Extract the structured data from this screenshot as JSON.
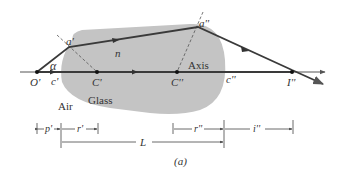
{
  "diagram": {
    "caption": "(a)",
    "colors": {
      "glass": "#c4c4c4",
      "ray": "#3a3a3a",
      "axis": "#555555",
      "dashed": "#555555",
      "background": "#ffffff"
    },
    "media": {
      "outside": "Air",
      "inside": "Glass",
      "index_label": "n"
    },
    "axis_label": "Axis",
    "points": {
      "object": "O'",
      "center_first": "C'",
      "center_second": "C''",
      "image": "I''",
      "vertex_first": "a'",
      "vertex_second": "a''"
    },
    "angle_label": "α",
    "segment_labels": {
      "c_first": "c'",
      "c_second": "c''"
    },
    "dimensions": {
      "p_prime": "p'",
      "r_prime": "r'",
      "r_double": "r''",
      "i_double": "i''",
      "length": "L"
    }
  }
}
